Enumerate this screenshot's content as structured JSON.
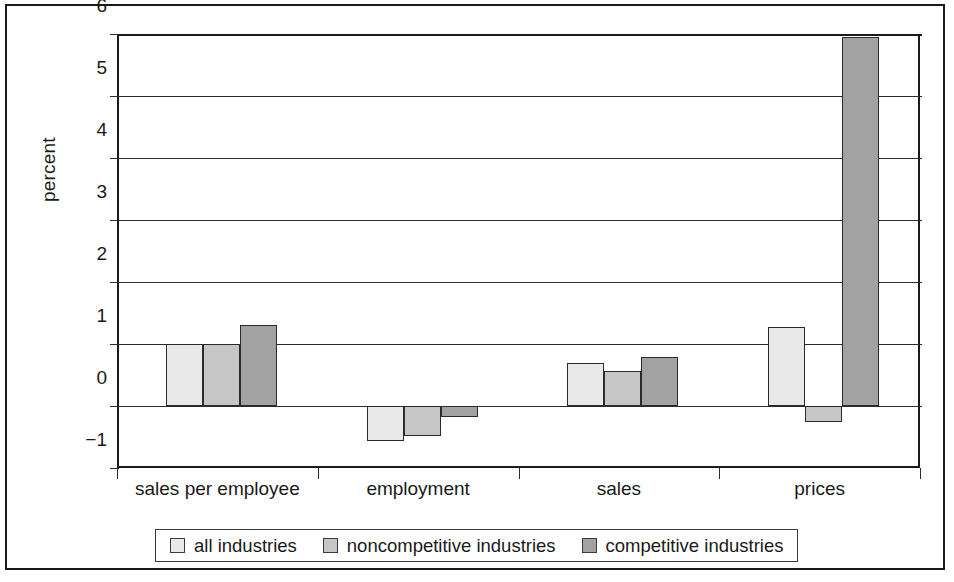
{
  "chart_data": {
    "type": "bar",
    "title": "",
    "subtitle": "",
    "xlabel": "",
    "ylabel": "percent",
    "ylim": [
      -1,
      6
    ],
    "yticks": [
      -1,
      0,
      1,
      2,
      3,
      4,
      5,
      6
    ],
    "ytick_labels": [
      "−1",
      "0",
      "1",
      "2",
      "3",
      "4",
      "5",
      "6"
    ],
    "grid": true,
    "grid_axis": "y",
    "legend_position": "bottom",
    "categories": [
      "sales per employee",
      "employment",
      "sales",
      "prices"
    ],
    "series": [
      {
        "name": "all industries",
        "color": "#e9e9e9",
        "values": [
          1.0,
          -0.57,
          0.7,
          1.28
        ]
      },
      {
        "name": "noncompetitive industries",
        "color": "#c6c6c6",
        "values": [
          1.0,
          -0.48,
          0.57,
          -0.25
        ]
      },
      {
        "name": "competitive industries",
        "color": "#a2a2a2",
        "values": [
          1.31,
          -0.18,
          0.79,
          5.95
        ]
      }
    ]
  },
  "legend": {
    "items": [
      {
        "label": "all industries",
        "swatch": "#e9e9e9"
      },
      {
        "label": "noncompetitive industries",
        "swatch": "#c6c6c6"
      },
      {
        "label": "competitive industries",
        "swatch": "#a2a2a2"
      }
    ]
  },
  "colors": {
    "axis": "#1a1a1a",
    "grid": "#2b2b2b",
    "background": "#ffffff",
    "frame": "#1a1a1a"
  }
}
